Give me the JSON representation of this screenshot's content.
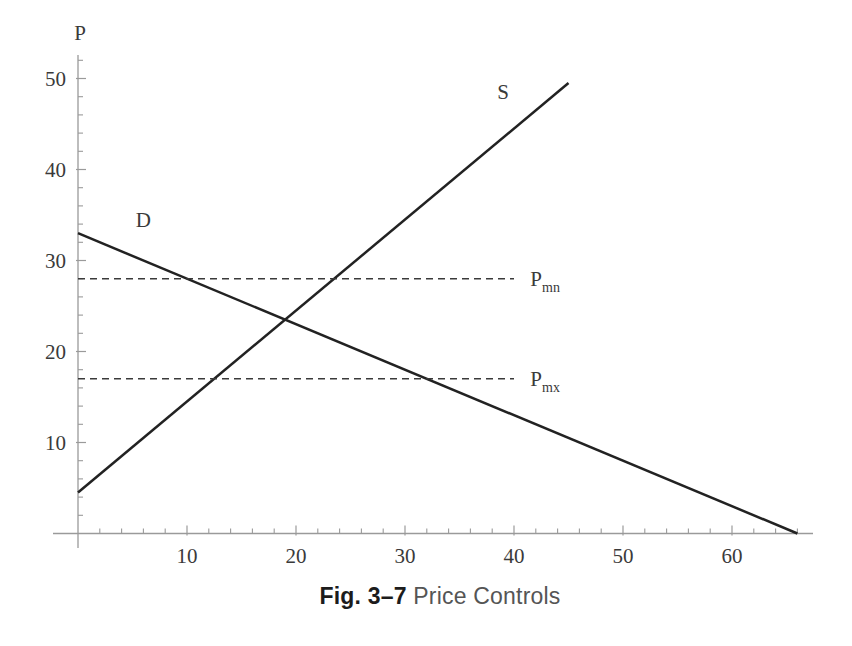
{
  "figure": {
    "caption_bold": "Fig. 3–7",
    "caption_rest": "Price Controls"
  },
  "chart_data": {
    "type": "line",
    "title": "Fig. 3–7 Price Controls",
    "xlabel": "",
    "ylabel": "P",
    "xlim": [
      0,
      67.5
    ],
    "ylim": [
      0,
      52.5
    ],
    "x_ticks": [
      10,
      20,
      30,
      40,
      50,
      60
    ],
    "y_ticks": [
      10,
      20,
      30,
      40,
      50
    ],
    "minor_tick_step": 2,
    "grid": false,
    "axis_color": "#9a9a9a",
    "line_color": "#222222",
    "dash_color": "#3a3a3a",
    "text_color": "#3a3a3a",
    "series": [
      {
        "name": "supply",
        "label": "S",
        "style": "solid",
        "points": [
          [
            0,
            4.5
          ],
          [
            45,
            49.5
          ]
        ],
        "label_x": 39,
        "label_y": 48.5,
        "label_anchor": "middle"
      },
      {
        "name": "demand",
        "label": "D",
        "style": "solid",
        "points": [
          [
            0,
            33
          ],
          [
            66,
            0
          ]
        ],
        "label_x": 6,
        "label_y": 34.5,
        "label_anchor": "middle"
      },
      {
        "name": "price-minimum",
        "label": "P",
        "sublabel": "mn",
        "style": "dashed",
        "points": [
          [
            0,
            28
          ],
          [
            40,
            28
          ]
        ],
        "label_x": 41.5,
        "label_y": 28,
        "label_anchor": "start"
      },
      {
        "name": "price-maximum",
        "label": "P",
        "sublabel": "mx",
        "style": "dashed",
        "points": [
          [
            0,
            17
          ],
          [
            40,
            17
          ]
        ],
        "label_x": 41.5,
        "label_y": 17,
        "label_anchor": "start"
      }
    ],
    "intersection": {
      "q": 19,
      "p": 23.5
    }
  }
}
